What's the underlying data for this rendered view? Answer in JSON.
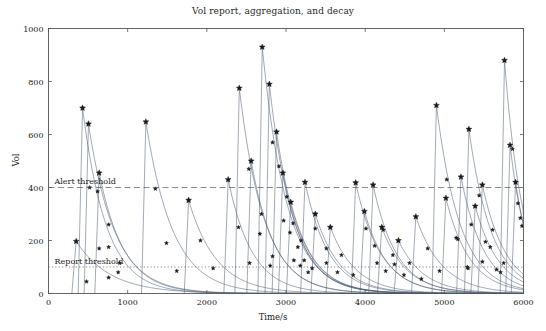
{
  "chart_data": {
    "type": "line",
    "title": "Vol report, aggregation, and decay",
    "xlabel": "Time/s",
    "ylabel": "Vol",
    "xlim": [
      0,
      6000
    ],
    "ylim": [
      0,
      1000
    ],
    "xticks": [
      0,
      1000,
      2000,
      3000,
      4000,
      5000,
      6000
    ],
    "yticks": [
      0,
      200,
      400,
      600,
      800,
      1000
    ],
    "grid": false,
    "legend": "none",
    "line_color": "#4a5a72",
    "marker_color": "#1a1a1a",
    "marker": "star",
    "annotations": [
      {
        "name": "alert-threshold",
        "label": "Alert threshold",
        "value": 400,
        "style": "dashed"
      },
      {
        "name": "report-threshold",
        "label": "Report threshold",
        "value": 100,
        "style": "dotted"
      }
    ],
    "series": [
      {
        "name": "event-1",
        "t0": 350,
        "peak": 197,
        "decay": 430,
        "markers": [
          [
            350,
            197
          ],
          [
            480,
            45
          ]
        ]
      },
      {
        "name": "event-2",
        "t0": 430,
        "peak": 700,
        "decay": 300,
        "markers": [
          [
            430,
            700
          ],
          [
            520,
            400
          ],
          [
            640,
            170
          ],
          [
            760,
            60
          ]
        ]
      },
      {
        "name": "event-3",
        "t0": 505,
        "peak": 640,
        "decay": 330,
        "markers": [
          [
            505,
            640
          ],
          [
            620,
            385
          ],
          [
            760,
            175
          ],
          [
            880,
            80
          ]
        ]
      },
      {
        "name": "event-4",
        "t0": 640,
        "peak": 455,
        "decay": 310,
        "markers": [
          [
            640,
            455
          ],
          [
            760,
            260
          ],
          [
            900,
            115
          ]
        ]
      },
      {
        "name": "event-5",
        "t0": 1230,
        "peak": 648,
        "decay": 340,
        "markers": [
          [
            1230,
            648
          ],
          [
            1350,
            395
          ],
          [
            1490,
            190
          ],
          [
            1620,
            85
          ]
        ]
      },
      {
        "name": "event-6",
        "t0": 1770,
        "peak": 352,
        "decay": 350,
        "markers": [
          [
            1770,
            352
          ],
          [
            1920,
            200
          ],
          [
            2080,
            95
          ]
        ]
      },
      {
        "name": "event-7",
        "t0": 2270,
        "peak": 430,
        "decay": 300,
        "markers": [
          [
            2270,
            430
          ],
          [
            2400,
            250
          ],
          [
            2540,
            115
          ]
        ]
      },
      {
        "name": "event-8",
        "t0": 2410,
        "peak": 775,
        "decay": 310,
        "markers": [
          [
            2410,
            775
          ],
          [
            2530,
            470
          ],
          [
            2670,
            225
          ],
          [
            2800,
            105
          ]
        ]
      },
      {
        "name": "event-9",
        "t0": 2560,
        "peak": 500,
        "decay": 300,
        "markers": [
          [
            2560,
            500
          ],
          [
            2690,
            300
          ],
          [
            2830,
            140
          ]
        ]
      },
      {
        "name": "event-10",
        "t0": 2700,
        "peak": 930,
        "decay": 310,
        "markers": [
          [
            2700,
            930
          ],
          [
            2830,
            570
          ],
          [
            2970,
            275
          ],
          [
            3100,
            125
          ]
        ]
      },
      {
        "name": "event-11",
        "t0": 2790,
        "peak": 790,
        "decay": 295,
        "markers": [
          [
            2790,
            790
          ],
          [
            2910,
            480
          ],
          [
            3050,
            230
          ],
          [
            3180,
            105
          ]
        ]
      },
      {
        "name": "event-12",
        "t0": 2880,
        "peak": 610,
        "decay": 300,
        "markers": [
          [
            2880,
            610
          ],
          [
            3010,
            365
          ],
          [
            3150,
            175
          ],
          [
            3280,
            80
          ]
        ]
      },
      {
        "name": "event-13",
        "t0": 2960,
        "peak": 455,
        "decay": 290,
        "markers": [
          [
            2960,
            455
          ],
          [
            3090,
            265
          ],
          [
            3230,
            125
          ]
        ]
      },
      {
        "name": "event-14",
        "t0": 3060,
        "peak": 345,
        "decay": 300,
        "markers": [
          [
            3060,
            345
          ],
          [
            3190,
            200
          ],
          [
            3330,
            95
          ]
        ]
      },
      {
        "name": "event-15",
        "t0": 3240,
        "peak": 420,
        "decay": 300,
        "markers": [
          [
            3240,
            420
          ],
          [
            3370,
            245
          ],
          [
            3510,
            115
          ]
        ]
      },
      {
        "name": "event-16",
        "t0": 3370,
        "peak": 300,
        "decay": 310,
        "markers": [
          [
            3370,
            300
          ],
          [
            3510,
            170
          ],
          [
            3650,
            80
          ]
        ]
      },
      {
        "name": "event-17",
        "t0": 3560,
        "peak": 250,
        "decay": 320,
        "markers": [
          [
            3560,
            250
          ],
          [
            3700,
            145
          ],
          [
            3850,
            70
          ]
        ]
      },
      {
        "name": "event-18",
        "t0": 3880,
        "peak": 418,
        "decay": 310,
        "markers": [
          [
            3880,
            418
          ],
          [
            4010,
            245
          ],
          [
            4150,
            115
          ]
        ]
      },
      {
        "name": "event-19",
        "t0": 3990,
        "peak": 310,
        "decay": 300,
        "markers": [
          [
            3990,
            310
          ],
          [
            4120,
            180
          ],
          [
            4260,
            85
          ]
        ]
      },
      {
        "name": "event-20",
        "t0": 4100,
        "peak": 410,
        "decay": 295,
        "markers": [
          [
            4100,
            410
          ],
          [
            4230,
            240
          ],
          [
            4370,
            110
          ]
        ]
      },
      {
        "name": "event-21",
        "t0": 4210,
        "peak": 250,
        "decay": 310,
        "markers": [
          [
            4210,
            250
          ],
          [
            4350,
            145
          ],
          [
            4490,
            70
          ]
        ]
      },
      {
        "name": "event-22",
        "t0": 4420,
        "peak": 200,
        "decay": 320,
        "markers": [
          [
            4420,
            200
          ],
          [
            4560,
            115
          ],
          [
            4710,
            55
          ]
        ]
      },
      {
        "name": "event-23",
        "t0": 4640,
        "peak": 290,
        "decay": 330,
        "markers": [
          [
            4640,
            290
          ],
          [
            4790,
            170
          ],
          [
            4940,
            85
          ]
        ]
      },
      {
        "name": "event-24",
        "t0": 4900,
        "peak": 710,
        "decay": 300,
        "markers": [
          [
            4900,
            710
          ],
          [
            5030,
            430
          ],
          [
            5170,
            205
          ],
          [
            5300,
            95
          ]
        ]
      },
      {
        "name": "event-25",
        "t0": 5020,
        "peak": 360,
        "decay": 300,
        "markers": [
          [
            5020,
            360
          ],
          [
            5150,
            210
          ],
          [
            5290,
            100
          ]
        ]
      },
      {
        "name": "event-26",
        "t0": 5210,
        "peak": 440,
        "decay": 290,
        "markers": [
          [
            5210,
            440
          ],
          [
            5340,
            260
          ],
          [
            5480,
            120
          ]
        ]
      },
      {
        "name": "event-27",
        "t0": 5310,
        "peak": 620,
        "decay": 290,
        "markers": [
          [
            5310,
            620
          ],
          [
            5440,
            370
          ],
          [
            5580,
            175
          ],
          [
            5710,
            80
          ]
        ]
      },
      {
        "name": "event-28",
        "t0": 5390,
        "peak": 330,
        "decay": 300,
        "markers": [
          [
            5390,
            330
          ],
          [
            5520,
            195
          ],
          [
            5660,
            90
          ]
        ]
      },
      {
        "name": "event-29",
        "t0": 5480,
        "peak": 410,
        "decay": 300,
        "markers": [
          [
            5480,
            410
          ],
          [
            5610,
            240
          ],
          [
            5750,
            115
          ]
        ]
      },
      {
        "name": "event-30",
        "t0": 5760,
        "peak": 880,
        "decay": 230,
        "markers": [
          [
            5760,
            880
          ],
          [
            5860,
            545
          ],
          [
            5960,
            285
          ]
        ]
      },
      {
        "name": "event-31",
        "t0": 5830,
        "peak": 560,
        "decay": 220,
        "markers": [
          [
            5830,
            560
          ],
          [
            5930,
            340
          ]
        ]
      },
      {
        "name": "event-32",
        "t0": 5900,
        "peak": 420,
        "decay": 210,
        "markers": [
          [
            5900,
            420
          ],
          [
            5980,
            255
          ]
        ]
      }
    ]
  }
}
